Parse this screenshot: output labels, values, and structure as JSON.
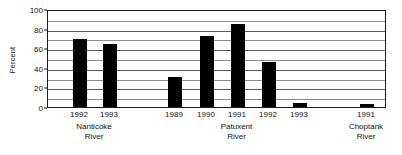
{
  "chart_data": {
    "type": "bar",
    "title": "",
    "subtitle": "",
    "xlabel": "",
    "ylabel": "Percent",
    "ylim": [
      0,
      100
    ],
    "yticks": [
      0,
      20,
      40,
      60,
      80,
      100
    ],
    "ytick_labels": [
      "0",
      "20",
      "40",
      "60",
      "80",
      "100"
    ],
    "gridlines": {
      "visible": true,
      "orientation": "horizontal",
      "minor_step": 10,
      "major_step": 20,
      "values": [
        10,
        20,
        30,
        40,
        50,
        60,
        70,
        80,
        90,
        100
      ]
    },
    "legend": {
      "visible": false,
      "position": "none"
    },
    "bar_color": "#000000",
    "categories": [
      "1992",
      "1993",
      "1989",
      "1990",
      "1991",
      "1992",
      "1993",
      "1991"
    ],
    "values": [
      69,
      64,
      31,
      72,
      85,
      46,
      4,
      3
    ],
    "groups": [
      {
        "name": "Nanticoke River",
        "name_lines": [
          "Nanticoke",
          "River"
        ],
        "bars": [
          {
            "category": "1992",
            "value": 69
          },
          {
            "category": "1993",
            "value": 64
          }
        ]
      },
      {
        "name": "Patuxent River",
        "name_lines": [
          "Patuxent",
          "River"
        ],
        "bars": [
          {
            "category": "1989",
            "value": 31
          },
          {
            "category": "1990",
            "value": 72
          },
          {
            "category": "1991",
            "value": 85
          },
          {
            "category": "1992",
            "value": 46
          },
          {
            "category": "1993",
            "value": 4
          }
        ]
      },
      {
        "name": "Choptank River",
        "name_lines": [
          "Choptank",
          "River"
        ],
        "bars": [
          {
            "category": "1991",
            "value": 3
          }
        ]
      }
    ]
  }
}
